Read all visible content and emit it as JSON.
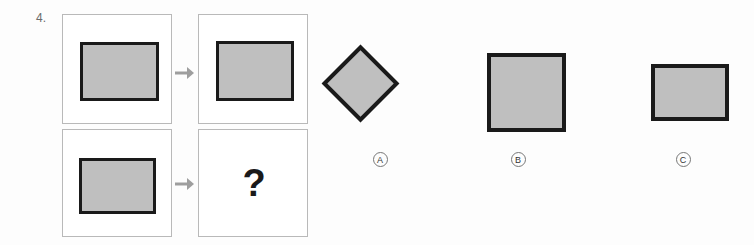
{
  "question": {
    "number": "4.",
    "unknown_marker": "?"
  },
  "matrix": {
    "cells": [
      {
        "id": "r1c1",
        "shape": "filled-rectangle",
        "position": "row1-left"
      },
      {
        "id": "r1c2",
        "shape": "filled-rectangle",
        "position": "row1-right"
      },
      {
        "id": "r2c1",
        "shape": "filled-rectangle",
        "position": "row2-left"
      },
      {
        "id": "r2c2",
        "shape": "question-mark",
        "position": "row2-right"
      }
    ],
    "arrows": [
      {
        "id": "row1-arrow",
        "glyph": "→"
      },
      {
        "id": "row2-arrow",
        "glyph": "→"
      }
    ]
  },
  "options": [
    {
      "key": "A",
      "label": "A",
      "shape": "diamond"
    },
    {
      "key": "B",
      "label": "B",
      "shape": "square"
    },
    {
      "key": "C",
      "label": "C",
      "shape": "wide-rectangle"
    }
  ],
  "colors": {
    "shape_fill": "#bfbfbf",
    "shape_stroke": "#1a1a1a",
    "panel_border": "#b9b9b9",
    "arrow": "#9e9e9e",
    "label_text": "#333333",
    "background": "#fdfdfd"
  }
}
